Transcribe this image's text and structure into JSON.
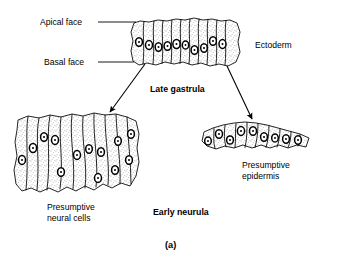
{
  "figure": {
    "caption": "(a)",
    "stage_top": "Late gastrula",
    "stage_bottom": "Early neurula"
  },
  "labels": {
    "apical_face": "Apical face",
    "basal_face": "Basal face",
    "ectoderm": "Ectoderm",
    "presumptive_neural_line1": "Presumptive",
    "presumptive_neural_line2": "neural cells",
    "presumptive_epidermis_line1": "Presumptive",
    "presumptive_epidermis_line2": "epidermis"
  },
  "colors": {
    "ink": "#000000",
    "paper": "#ffffff",
    "cytoplasm": "#f2f0ec"
  },
  "structures": {
    "ectoderm_cells": 10,
    "neural_cells": 11,
    "epidermis_cells": 9
  }
}
